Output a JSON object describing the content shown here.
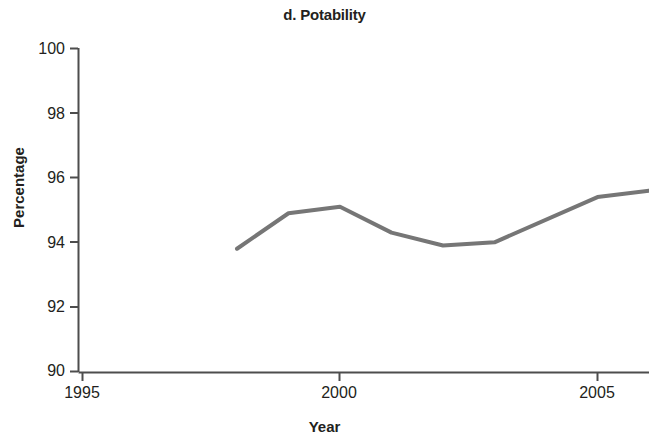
{
  "chart_data": {
    "type": "line",
    "title": "d. Potability",
    "xlabel": "Year",
    "ylabel": "Percentage",
    "xlim": [
      1995,
      2006.2
    ],
    "ylim": [
      90,
      100
    ],
    "xticks": [
      1995,
      2000,
      2005
    ],
    "xtick_labels": [
      "1995",
      "2000",
      "2005"
    ],
    "yticks": [
      90,
      92,
      94,
      96,
      98,
      100
    ],
    "ytick_labels": [
      "90",
      "92",
      "94",
      "96",
      "98",
      "100"
    ],
    "grid": false,
    "legend": null,
    "line_color": "#767676",
    "line_width": 4,
    "series": [
      {
        "name": "Potability",
        "x": [
          1998,
          1999,
          2000,
          2001,
          2002,
          2003,
          2005,
          2006
        ],
        "values": [
          93.8,
          94.9,
          95.1,
          94.3,
          93.9,
          94.0,
          95.4,
          95.6
        ]
      }
    ]
  },
  "axis": {
    "color": "#4d4d4d",
    "tick_length": 6
  }
}
